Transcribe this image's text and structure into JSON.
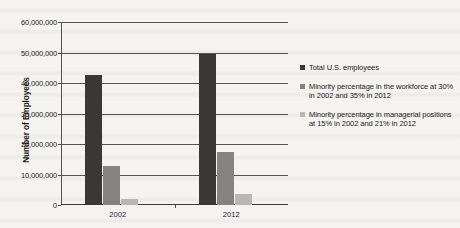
{
  "chart_data": {
    "type": "bar",
    "title": "",
    "xlabel": "",
    "ylabel": "Number of Employees",
    "categories": [
      "2002",
      "2012"
    ],
    "ylim": [
      0,
      60000000
    ],
    "yticks": [
      0,
      10000000,
      20000000,
      30000000,
      40000000,
      50000000,
      60000000
    ],
    "ytick_labels": [
      "0",
      "10,000,000",
      "20,000,000",
      "30,000,000",
      "40,000,000",
      "50,000,000",
      "60,000,000"
    ],
    "grid": true,
    "legend_position": "right",
    "series": [
      {
        "name": "Total U.S. employees",
        "color": "#3a3836",
        "values": [
          42500000,
          49500000
        ]
      },
      {
        "name": "Minority percentage in the workforce at 30% in 2002 and 35% in 2012",
        "color": "#858382",
        "values": [
          12750000,
          17325000
        ]
      },
      {
        "name": "Minority percentage in managerial positions at 15% in 2002 and 21% in 2012",
        "color": "#b9b7b4",
        "values": [
          1900000,
          3600000
        ]
      }
    ]
  },
  "axis": {
    "y_title": "Number of Employees"
  }
}
